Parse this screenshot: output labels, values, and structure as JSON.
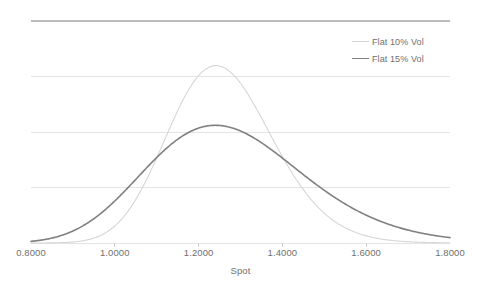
{
  "chart_data": {
    "type": "line",
    "title": "",
    "xlabel": "Spot",
    "ylabel": "Probability Distribution Function",
    "xlim": [
      0.8,
      1.8
    ],
    "ylim": [
      0,
      4.0
    ],
    "grid": true,
    "grid_y_values": [
      0,
      1.0,
      2.0,
      3.0,
      4.0
    ],
    "legend_position": "top-right",
    "x_tick_labels": [
      "0.8000",
      "1.0000",
      "1.2000",
      "1.4000",
      "1.6000",
      "1.8000"
    ],
    "x_tick_values": [
      0.8,
      1.0,
      1.2,
      1.4,
      1.6,
      1.8
    ],
    "y_tick_labels": [],
    "series": [
      {
        "name": "Flat 10% Vol",
        "color": "#d6d6d6",
        "line_width": 1.1,
        "peak_x": 1.25,
        "peak_y": 3.99,
        "distribution": "lognormal",
        "median": 1.2542,
        "sigma": 0.1,
        "x": [
          0.8,
          0.85,
          0.9,
          0.95,
          1.0,
          1.05,
          1.1,
          1.15,
          1.2,
          1.25,
          1.3,
          1.35,
          1.4,
          1.45,
          1.5,
          1.55,
          1.6,
          1.65,
          1.7,
          1.75,
          1.8
        ],
        "values": [
          0.0004,
          0.0053,
          0.0406,
          0.1883,
          0.5763,
          1.2574,
          2.1215,
          2.9748,
          3.6351,
          3.9882,
          3.9839,
          3.6618,
          3.133,
          2.5199,
          1.92,
          1.3955,
          0.9728,
          0.6535,
          0.4252,
          0.2688,
          0.1656
        ]
      },
      {
        "name": "Flat 15% Vol",
        "color": "#808080",
        "line_width": 1.6,
        "peak_x": 1.24,
        "peak_y": 2.66,
        "distribution": "lognormal",
        "median": 1.2684,
        "sigma": 0.15,
        "x": [
          0.8,
          0.85,
          0.9,
          0.95,
          1.0,
          1.05,
          1.1,
          1.15,
          1.2,
          1.25,
          1.3,
          1.35,
          1.4,
          1.45,
          1.5,
          1.55,
          1.6,
          1.65,
          1.7,
          1.75,
          1.8
        ],
        "values": [
          0.0631,
          0.1734,
          0.3669,
          0.6435,
          0.9815,
          1.3393,
          1.6722,
          1.9446,
          2.1339,
          2.2328,
          2.2473,
          2.1927,
          2.0876,
          1.9497,
          1.7939,
          1.632,
          1.4722,
          1.32,
          1.1786,
          1.0495,
          0.9332
        ]
      }
    ]
  },
  "axes": {
    "x_title": "Spot",
    "y_title": "Probability Distribution Function",
    "tick_labels": [
      {
        "text": "0.8000",
        "value": 0.8
      },
      {
        "text": "1.0000",
        "value": 1.0
      },
      {
        "text": "1.2000",
        "value": 1.2
      },
      {
        "text": "1.4000",
        "value": 1.4
      },
      {
        "text": "1.6000",
        "value": 1.6
      },
      {
        "text": "1.8000",
        "value": 1.8
      }
    ]
  },
  "legend": {
    "items": [
      {
        "label": "Flat 10% Vol",
        "color": "#d6d6d6",
        "width": 1.1
      },
      {
        "label": "Flat 15% Vol",
        "color": "#808080",
        "width": 1.6
      }
    ]
  },
  "style": {
    "background": "#ffffff",
    "gridline_color": "#e4e4e4",
    "top_border_color": "#bdbdbd",
    "axis_line_color": "#d0d0d0",
    "text_color": "#6f6f6f"
  }
}
